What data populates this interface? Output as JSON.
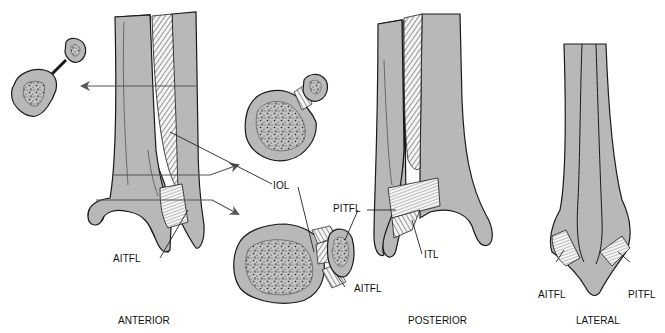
{
  "figure": {
    "colors": {
      "bone_fill": "#b8b8b8",
      "outline": "#1a1a1a",
      "ligament_fill": "#f2f2f2",
      "arrow": "#555555",
      "background": "#ffffff"
    },
    "views": [
      {
        "id": "anterior",
        "title": "ANTERIOR"
      },
      {
        "id": "posterior",
        "title": "POSTERIOR"
      },
      {
        "id": "lateral",
        "title": "LATERAL"
      }
    ],
    "labels": {
      "iol": "IOL",
      "aitfl_anterior": "AITFL",
      "aitfl_cross_section": "AITFL",
      "pitfl_cross_section": "PITFL",
      "pitfl_posterior": "PITFL",
      "itl": "ITL",
      "aitfl_lateral": "AITFL",
      "pitfl_lateral": "PITFL"
    },
    "cross_sections": [
      {
        "id": "proximal-section",
        "description": "Proximal shaft cross-section (tibia and fibula joined by membrane)"
      },
      {
        "id": "mid-section",
        "description": "Mid-level cross-section with interosseous ligament"
      },
      {
        "id": "distal-section",
        "description": "Distal cross-section with AITFL and PITFL"
      }
    ]
  }
}
